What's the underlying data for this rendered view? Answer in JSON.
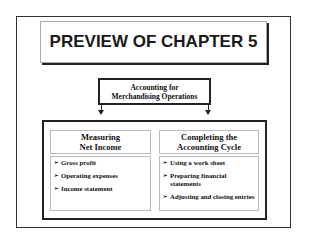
{
  "title": "PREVIEW OF CHAPTER 5",
  "center_box": {
    "line1": "Accounting for",
    "line2": "Merchandising Operations"
  },
  "columns": [
    {
      "header_line1": "Measuring",
      "header_line2": "Net Income",
      "items": [
        "Gross profit",
        "Operating expenses",
        "Income statement"
      ]
    },
    {
      "header_line1": "Completing the",
      "header_line2": "Accounting Cycle",
      "items": [
        "Using a work sheet",
        "Preparing financial statements",
        "Adjusting and closing entries"
      ]
    }
  ],
  "bullet_glyph": "➢"
}
